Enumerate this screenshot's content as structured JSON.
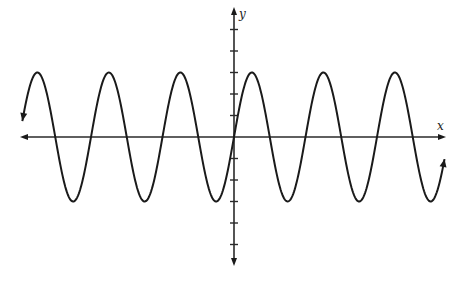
{
  "chart_data": {
    "type": "line",
    "title": "",
    "xlabel": "x",
    "ylabel": "y",
    "function": "y = 3 sin(x)",
    "amplitude": 3,
    "period": 6.2832,
    "xlim": [
      -18.6,
      18.5
    ],
    "ylim": [
      -5,
      5
    ],
    "y_ticks": [
      -5,
      -4,
      -3,
      -2,
      -1,
      1,
      2,
      3,
      4,
      5
    ],
    "x_ticks": [],
    "grid": false,
    "legend": "none",
    "curve_arrows": [
      "left",
      "right"
    ],
    "series": [
      {
        "name": "sine curve",
        "x_start": -18.6,
        "x_end": 18.5,
        "samples": 600
      }
    ]
  }
}
